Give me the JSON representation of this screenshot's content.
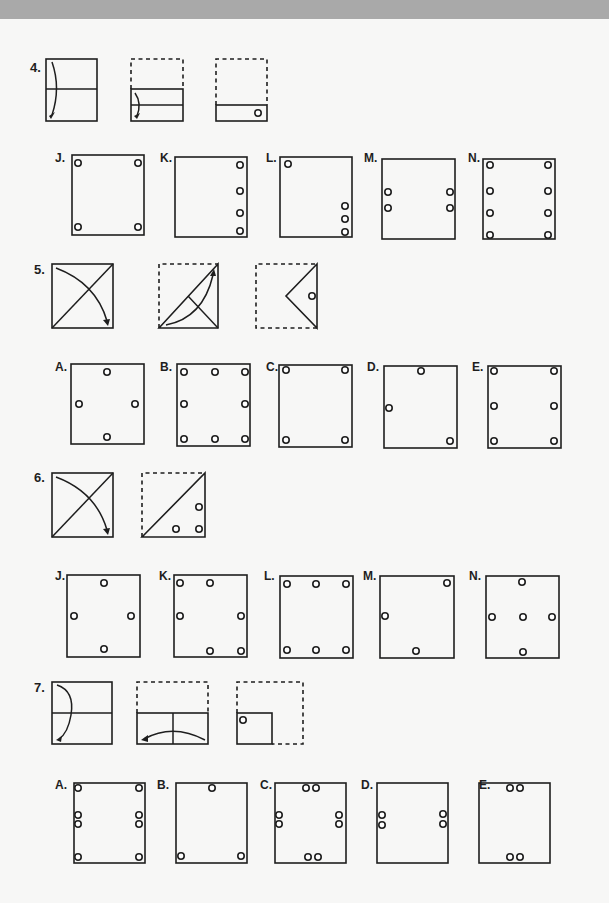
{
  "questions": [
    {
      "number": "4.",
      "choices": [
        {
          "letter": "J.",
          "holes": 4
        },
        {
          "letter": "K.",
          "holes": 4
        },
        {
          "letter": "L.",
          "holes": 4
        },
        {
          "letter": "M.",
          "holes": 4
        },
        {
          "letter": "N.",
          "holes": 8
        }
      ]
    },
    {
      "number": "5.",
      "choices": [
        {
          "letter": "A.",
          "holes": 4
        },
        {
          "letter": "B.",
          "holes": 8
        },
        {
          "letter": "C.",
          "holes": 4
        },
        {
          "letter": "D.",
          "holes": 3
        },
        {
          "letter": "E.",
          "holes": 6
        }
      ]
    },
    {
      "number": "6.",
      "choices": [
        {
          "letter": "J.",
          "holes": 4
        },
        {
          "letter": "K.",
          "holes": 6
        },
        {
          "letter": "L.",
          "holes": 6
        },
        {
          "letter": "M.",
          "holes": 3
        },
        {
          "letter": "N.",
          "holes": 5
        }
      ]
    },
    {
      "number": "7.",
      "choices": [
        {
          "letter": "A.",
          "holes": 8
        },
        {
          "letter": "B.",
          "holes": 3
        },
        {
          "letter": "C.",
          "holes": 8
        },
        {
          "letter": "D.",
          "holes": 4
        },
        {
          "letter": "E.",
          "holes": 4
        }
      ]
    }
  ],
  "colors": {
    "ink": "#1e1e1e",
    "paper": "#f7f7f6",
    "top_band": "#a9a9a9"
  }
}
